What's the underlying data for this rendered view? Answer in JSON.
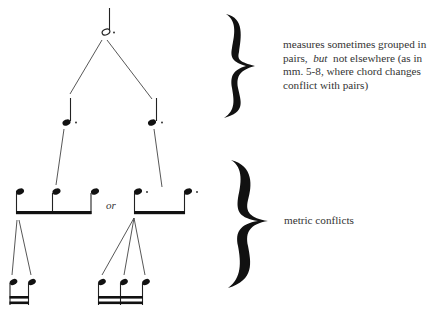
{
  "diagram": {
    "type": "metric-hierarchy-tree",
    "levels": [
      {
        "level": 1,
        "notes": [
          "dotted half note"
        ]
      },
      {
        "level": 2,
        "notes": [
          "dotted quarter note",
          "dotted quarter note"
        ]
      },
      {
        "level": 3,
        "alternatives": [
          "three beamed eighth notes",
          "two beamed dotted eighth notes"
        ],
        "separator": "or"
      },
      {
        "level": 4,
        "groups": [
          "two beamed sixteenth notes",
          "three beamed sixteenth notes"
        ]
      }
    ],
    "or_label": "or",
    "annotations": [
      {
        "brace": "upper",
        "text_part1": "measures sometimes grouped in pairs,",
        "text_emphasis": "but",
        "text_part2": "not elsewhere (as in mm. 5-8,  where  chord changes conflict with pairs)"
      },
      {
        "brace": "lower",
        "text": "metric conflicts"
      }
    ]
  },
  "colors": {
    "ink": "#111111",
    "text": "#333333",
    "background": "#ffffff"
  }
}
